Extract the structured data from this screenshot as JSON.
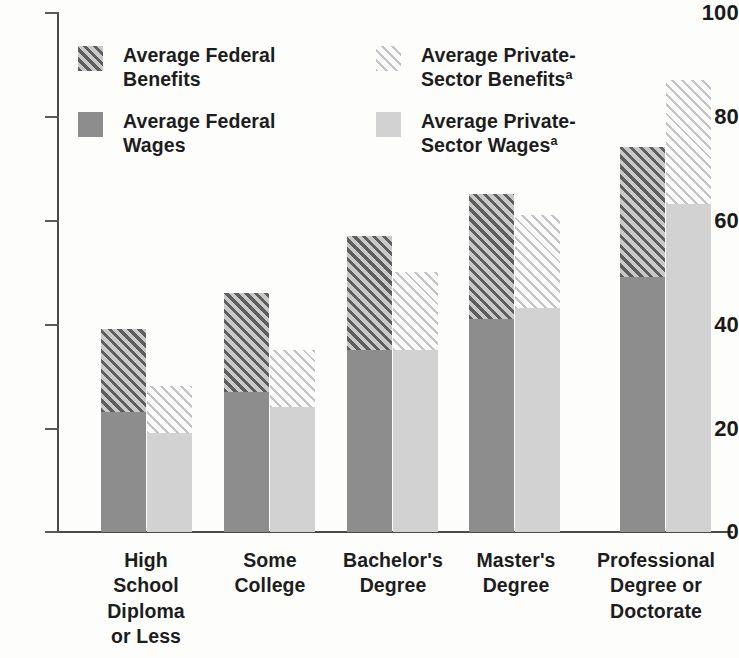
{
  "chart_data": {
    "type": "bar",
    "subtype": "grouped-stacked",
    "title": "",
    "subtitle": "",
    "xlabel": "",
    "ylabel": "",
    "ylim": [
      0,
      100
    ],
    "ytick_labels": [
      "100",
      "80",
      "60",
      "40",
      "20",
      "0"
    ],
    "ytick_values": [
      100,
      80,
      60,
      40,
      20,
      0
    ],
    "grid": false,
    "legend_position": "upper-left-inside",
    "categories": [
      "High\nSchool\nDiploma\nor Less",
      "Some\nCollege",
      "Bachelor's\nDegree",
      "Master's\nDegree",
      "Professional\nDegree or\nDoctorate"
    ],
    "series": [
      {
        "name": "Average Federal Wages",
        "key": "federal_wages",
        "stack": "federal",
        "color": "#8d8d8d",
        "pattern": "solid",
        "values": [
          23,
          27,
          35,
          41,
          49
        ]
      },
      {
        "name": "Average Federal Benefits",
        "key": "federal_benefits",
        "stack": "federal",
        "color": "#5e5e5e",
        "pattern": "diagonal-hatch-dark",
        "values": [
          16,
          19,
          22,
          24,
          25
        ]
      },
      {
        "name": "Average Private-Sector Wages",
        "key": "private_wages",
        "stack": "private",
        "color": "#d2d2d2",
        "pattern": "solid",
        "values": [
          19,
          24,
          35,
          43,
          63
        ]
      },
      {
        "name": "Average Private-Sector Benefits",
        "key": "private_benefits",
        "stack": "private",
        "color": "#c3c3c3",
        "pattern": "diagonal-hatch-light",
        "values": [
          9,
          11,
          15,
          18,
          24
        ]
      }
    ],
    "stack_totals": {
      "federal": [
        39,
        46,
        57,
        65,
        74
      ],
      "private": [
        28,
        35,
        50,
        61,
        87
      ]
    }
  },
  "legend": {
    "items": [
      {
        "label": "Average Federal\nBenefits",
        "swatch": "dark-hatch-swatch",
        "footnote": ""
      },
      {
        "label": "Average Private-\nSector Benefits",
        "swatch": "light-hatch-swatch",
        "footnote": "a"
      },
      {
        "label": "Average Federal\nWages",
        "swatch": "dark-solid-swatch",
        "footnote": ""
      },
      {
        "label": "Average Private-\nSector Wages",
        "swatch": "light-solid-swatch",
        "footnote": "a"
      }
    ]
  },
  "axis": {
    "ticks": [
      "100",
      "80",
      "60",
      "40",
      "20",
      "0"
    ]
  },
  "colors": {
    "federal_wages": "#8d8d8d",
    "federal_benefits_line": "#5e5e5e",
    "private_wages": "#d2d2d2",
    "private_benefits_line": "#c3c3c3",
    "axis": "#4a4a4a",
    "text": "#1a1a1a",
    "background": "#fdfdfc"
  }
}
